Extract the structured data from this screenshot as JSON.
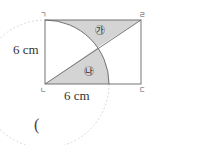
{
  "figure": {
    "vertices": {
      "top_left": "ㄱ",
      "bottom_left": "ㄴ",
      "bottom_right": "ㄷ",
      "top_right": "ㄹ"
    },
    "regions": {
      "upper": "㉮",
      "lower": "㉯"
    },
    "dimensions": {
      "height_label": "6 cm",
      "width_label": "6 cm"
    },
    "colors": {
      "shade": "#d4d4d4",
      "line": "#666666",
      "dashed_circle": "#cccccc"
    }
  },
  "answer": {
    "open_paren": "("
  }
}
